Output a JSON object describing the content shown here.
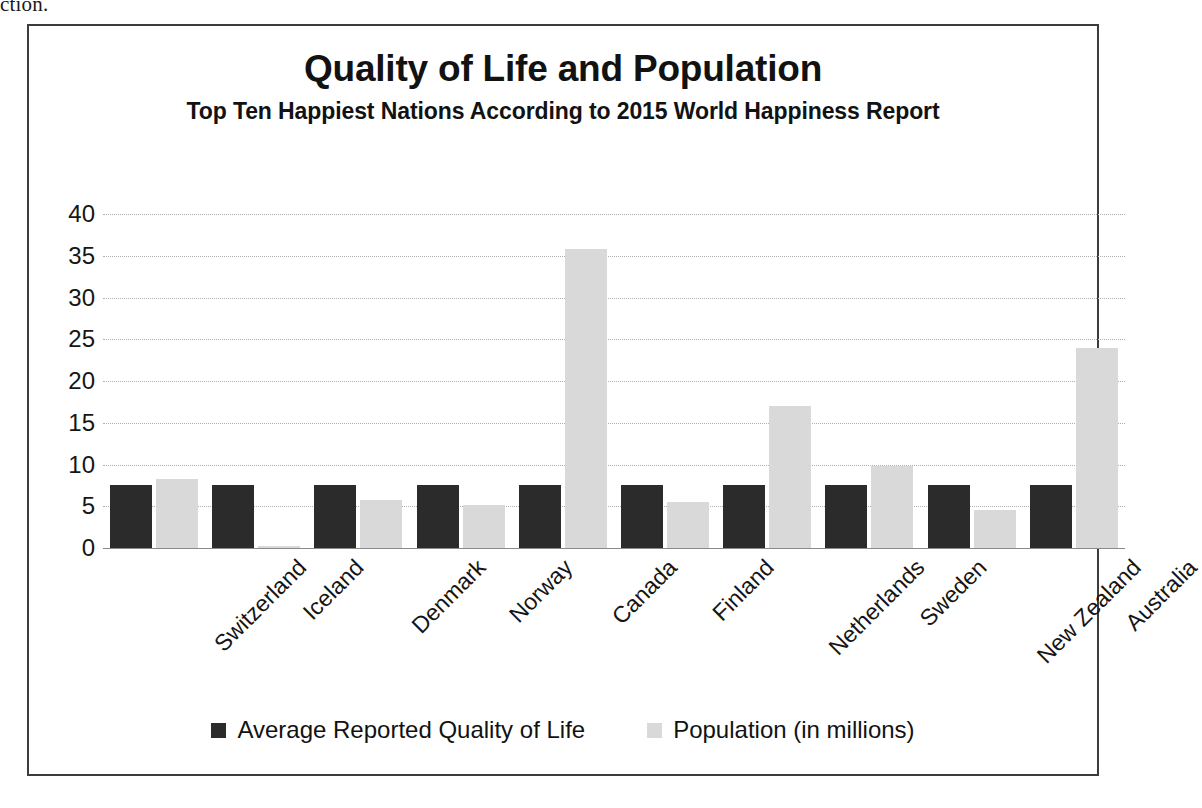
{
  "page": {
    "cut_off_text": "ction."
  },
  "legend": {
    "position": "bottom",
    "entries": [
      {
        "label": "Average Reported Quality of Life",
        "color": "#2b2b2b"
      },
      {
        "label": "Population (in millions)",
        "color": "#d9d9d9"
      }
    ]
  },
  "chart_data": {
    "type": "bar",
    "title": "Quality of Life and Population",
    "subtitle": "Top Ten Happiest Nations According to 2015 World Happiness Report",
    "xlabel": "",
    "ylabel": "",
    "ylim": [
      0,
      40
    ],
    "ytick_step": 5,
    "yticks": [
      40,
      35,
      30,
      25,
      20,
      15,
      10,
      5,
      0
    ],
    "grid": true,
    "categories": [
      "Switzerland",
      "Iceland",
      "Denmark",
      "Norway",
      "Canada",
      "Finland",
      "Netherlands",
      "Sweden",
      "New Zealand",
      "Australia"
    ],
    "series": [
      {
        "name": "Average Reported Quality of Life",
        "color": "#2b2b2b",
        "values": [
          7.6,
          7.6,
          7.6,
          7.6,
          7.6,
          7.6,
          7.6,
          7.6,
          7.6,
          7.6
        ]
      },
      {
        "name": "Population (in millions)",
        "color": "#d9d9d9",
        "values": [
          8.3,
          0.3,
          5.7,
          5.2,
          35.8,
          5.5,
          17.0,
          9.8,
          4.6,
          24.0
        ]
      }
    ]
  }
}
